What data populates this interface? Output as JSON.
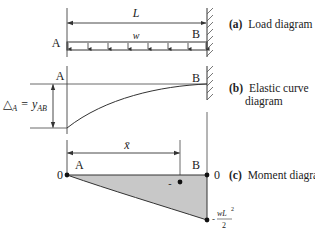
{
  "diagram": {
    "colors": {
      "line": "#333333",
      "fill": "#c8c8c8",
      "text": "#222222"
    },
    "load_diagram": {
      "caption_label": "(a)",
      "caption_text": "Load diagram",
      "span_label": "L",
      "load_label": "w",
      "left_point": "A",
      "right_point": "B",
      "support": "fixed wall at B"
    },
    "elastic_curve": {
      "caption_label": "(b)",
      "caption_text_line1": "Elastic curve",
      "caption_text_line2": "diagram",
      "left_point": "A",
      "right_point": "B",
      "deflection_symbol": "△",
      "deflection_sub": "A",
      "equals": "=",
      "y_symbol": "y",
      "y_sub": "AB"
    },
    "moment_diagram": {
      "caption_label": "(c)",
      "caption_text": "Moment diagram",
      "left_point": "A",
      "right_point": "B",
      "left_value": "0",
      "right_value": "0",
      "centroid_label": "x̄",
      "sign_label": "-",
      "min_prefix": "-",
      "min_numerator": "wL",
      "min_exponent": "2",
      "min_denominator": "2"
    }
  }
}
